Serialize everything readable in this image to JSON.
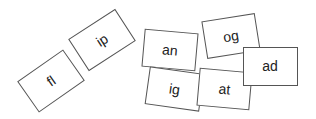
{
  "cards": [
    {
      "label": "fl",
      "cx": 51,
      "cy": 81,
      "w": 56,
      "h": 38,
      "rot": -35
    },
    {
      "label": "ip",
      "cx": 102,
      "cy": 40,
      "w": 56,
      "h": 38,
      "rot": -33
    },
    {
      "label": "an",
      "cx": 170,
      "cy": 50,
      "w": 54,
      "h": 38,
      "rot": 5
    },
    {
      "label": "og",
      "cx": 231,
      "cy": 36,
      "w": 54,
      "h": 38,
      "rot": -9
    },
    {
      "label": "ig",
      "cx": 174,
      "cy": 89,
      "w": 55,
      "h": 38,
      "rot": 8
    },
    {
      "label": "at",
      "cx": 224,
      "cy": 89,
      "w": 53,
      "h": 38,
      "rot": 5
    },
    {
      "label": "ad",
      "cx": 270,
      "cy": 66,
      "w": 55,
      "h": 39,
      "rot": 0
    }
  ]
}
